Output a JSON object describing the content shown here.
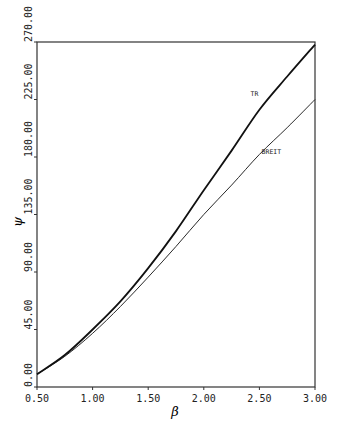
{
  "page_header_fragment": "",
  "chart_data": {
    "type": "line",
    "title": "",
    "xlabel": "β",
    "ylabel": "ψ",
    "xlim": [
      0.5,
      3.0
    ],
    "ylim": [
      0.0,
      270.0
    ],
    "grid": false,
    "legend_position": "inline labels",
    "x_ticks": [
      "0.50",
      "1.00",
      "1.50",
      "2.00",
      "2.50",
      "3.00"
    ],
    "y_ticks": [
      "0.00",
      "45.00",
      "90.00",
      "135.00",
      "180.00",
      "225.00",
      "270.00"
    ],
    "x": [
      0.5,
      0.75,
      1.0,
      1.25,
      1.5,
      1.75,
      2.0,
      2.25,
      2.5,
      2.75,
      3.0
    ],
    "series": [
      {
        "name": "TR",
        "style": "thick",
        "values": [
          10,
          25,
          45,
          67,
          93,
          122,
          154,
          185,
          217,
          243,
          268
        ]
      },
      {
        "name": "BREIT",
        "style": "thin",
        "values": [
          10,
          24,
          42,
          63,
          86,
          110,
          135,
          158,
          182,
          203,
          225
        ]
      }
    ],
    "annotations": [
      {
        "text": "TR",
        "x": 2.42,
        "y": 228
      },
      {
        "text": "BREIT",
        "x": 2.52,
        "y": 182
      }
    ]
  }
}
